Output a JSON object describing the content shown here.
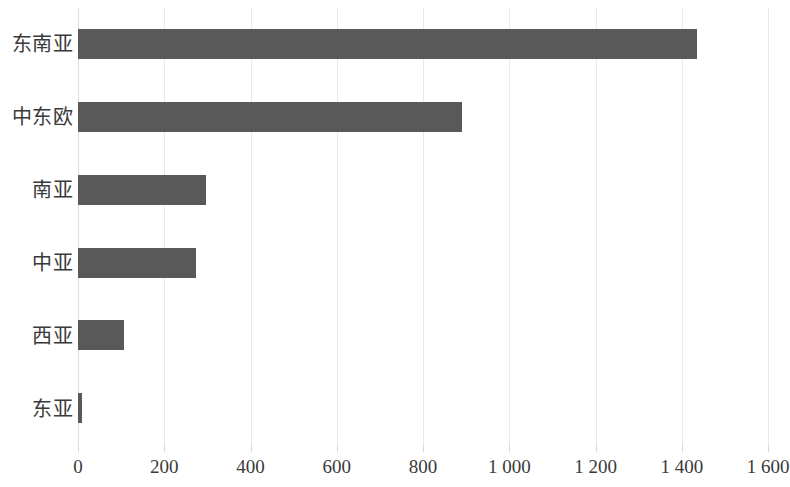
{
  "chart_data": {
    "type": "bar",
    "orientation": "horizontal",
    "title": "",
    "subtitle": "",
    "xlabel": "",
    "ylabel": "",
    "categories": [
      "东南亚",
      "中东欧",
      "南亚",
      "中亚",
      "西亚",
      "东亚"
    ],
    "values": [
      1435,
      890,
      297,
      274,
      107,
      10
    ],
    "series": [
      {
        "name": "",
        "values": [
          1435,
          890,
          297,
          274,
          107,
          10
        ]
      }
    ],
    "xlim": [
      0,
      1600
    ],
    "xticks": [
      0,
      200,
      400,
      600,
      800,
      1000,
      1200,
      1400,
      1600
    ],
    "xtick_labels": [
      "0",
      "200",
      "400",
      "600",
      "800",
      "1 000",
      "1 200",
      "1 400",
      "1 600"
    ],
    "grid": "vertical",
    "legend": "none",
    "bar_color": "#595959",
    "gridline_color": "#e8e8e8",
    "background_color": "#ffffff",
    "text_color": "#3a3a3a"
  },
  "axis": {
    "x": {
      "ticks": [
        {
          "value": 0,
          "label": "0"
        },
        {
          "value": 200,
          "label": "200"
        },
        {
          "value": 400,
          "label": "400"
        },
        {
          "value": 600,
          "label": "600"
        },
        {
          "value": 800,
          "label": "800"
        },
        {
          "value": 1000,
          "label": "1 000"
        },
        {
          "value": 1200,
          "label": "1 200"
        },
        {
          "value": 1400,
          "label": "1 400"
        },
        {
          "value": 1600,
          "label": "1 600"
        }
      ]
    },
    "y": {
      "categories": [
        {
          "label": "东南亚",
          "value": 1435
        },
        {
          "label": "中东欧",
          "value": 890
        },
        {
          "label": "南亚",
          "value": 297
        },
        {
          "label": "中亚",
          "value": 274
        },
        {
          "label": "西亚",
          "value": 107
        },
        {
          "label": "东亚",
          "value": 10
        }
      ]
    }
  }
}
